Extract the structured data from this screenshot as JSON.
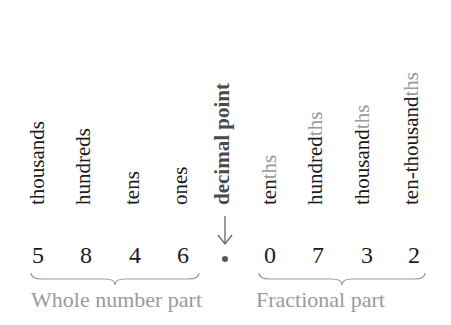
{
  "place_values": {
    "thousands": {
      "label": "thousands"
    },
    "hundreds": {
      "label": "hundreds"
    },
    "tens": {
      "label": "tens"
    },
    "ones": {
      "label": "ones"
    },
    "decimal_point": {
      "label": "decimal point"
    },
    "tenths": {
      "stem": "ten",
      "suffix": "ths"
    },
    "hundredths": {
      "stem": "hundred",
      "suffix": "ths"
    },
    "thousandths": {
      "stem": "thousand",
      "suffix": "ths"
    },
    "ten_thousandths": {
      "stem": "ten-thousand",
      "suffix": "ths"
    }
  },
  "number": {
    "whole_digits": [
      "5",
      "8",
      "4",
      "6"
    ],
    "fraction_digits": [
      "0",
      "7",
      "3",
      "2"
    ],
    "separator": "•"
  },
  "parts": {
    "whole": "Whole number part",
    "fractional": "Fractional part"
  },
  "colors": {
    "text": "#1a1a1a",
    "muted": "#9a9a9a",
    "emphasis": "#4a4a4a"
  }
}
